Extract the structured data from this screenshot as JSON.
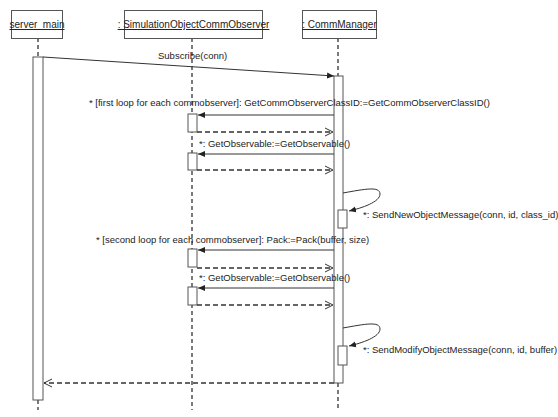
{
  "diagram": {
    "type": "UML sequence diagram",
    "lifelines": [
      {
        "id": "server_main",
        "label": "server_main"
      },
      {
        "id": "observer",
        "label": ": SimulationObjectCommObserver"
      },
      {
        "id": "manager",
        "label": ": CommManager"
      }
    ],
    "messages": [
      {
        "from": "server_main",
        "to": "manager",
        "kind": "sync",
        "label": "Subscribe(conn)"
      },
      {
        "from": "manager",
        "to": "observer",
        "kind": "sync",
        "label": "* [first loop for each commobserver]: GetCommObserverClassID:=GetCommObserverClassID()"
      },
      {
        "from": "observer",
        "to": "manager",
        "kind": "return",
        "label": ""
      },
      {
        "from": "manager",
        "to": "observer",
        "kind": "sync",
        "label": "*: GetObservable:=GetObservable()"
      },
      {
        "from": "observer",
        "to": "manager",
        "kind": "return",
        "label": ""
      },
      {
        "from": "manager",
        "to": "manager",
        "kind": "self",
        "label": "*: SendNewObjectMessage(conn, id, class_id)"
      },
      {
        "from": "manager",
        "to": "observer",
        "kind": "sync",
        "label": "* [second loop for each commobserver]: Pack:=Pack(buffer, size)"
      },
      {
        "from": "observer",
        "to": "manager",
        "kind": "return",
        "label": ""
      },
      {
        "from": "manager",
        "to": "observer",
        "kind": "sync",
        "label": "*: GetObservable:=GetObservable()"
      },
      {
        "from": "observer",
        "to": "manager",
        "kind": "return",
        "label": ""
      },
      {
        "from": "manager",
        "to": "manager",
        "kind": "self",
        "label": "*: SendModifyObjectMessage(conn, id, buffer)"
      },
      {
        "from": "manager",
        "to": "server_main",
        "kind": "return",
        "label": ""
      }
    ]
  },
  "colors": {
    "line": "#333333",
    "box_border": "#555555",
    "text": "#222222",
    "background": "#ffffff"
  }
}
